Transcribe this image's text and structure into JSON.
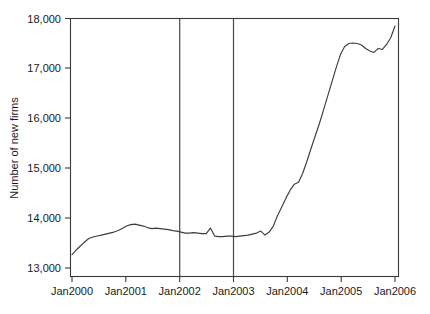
{
  "chart_data": {
    "type": "line",
    "title": "",
    "xlabel": "",
    "ylabel": "Number of new firms",
    "xlim": [
      "Jan2000",
      "Jan2006"
    ],
    "ylim": [
      13000,
      18000
    ],
    "grid": false,
    "legend": "none",
    "x_tick_labels": [
      "Jan2000",
      "Jan2001",
      "Jan2002",
      "Jan2003",
      "Jan2004",
      "Jan2005",
      "Jan2006"
    ],
    "y_tick_labels": [
      "13,000",
      "14,000",
      "15,000",
      "16,000",
      "17,000",
      "18,000"
    ],
    "y_tick_values": [
      13000,
      14000,
      15000,
      16000,
      17000,
      18000
    ],
    "annotations": [
      {
        "name": "reference-line-jan2002",
        "type": "vertical-line",
        "x": "Jan2002"
      },
      {
        "name": "reference-line-jan2003",
        "type": "vertical-line",
        "x": "Jan2003"
      }
    ],
    "series": [
      {
        "name": "New firms",
        "color": "#3d3d3d",
        "x": [
          "Jan2000",
          "Feb2000",
          "Mar2000",
          "Apr2000",
          "May2000",
          "Jun2000",
          "Jul2000",
          "Aug2000",
          "Sep2000",
          "Oct2000",
          "Nov2000",
          "Dec2000",
          "Jan2001",
          "Feb2001",
          "Mar2001",
          "Apr2001",
          "May2001",
          "Jun2001",
          "Jul2001",
          "Aug2001",
          "Sep2001",
          "Oct2001",
          "Nov2001",
          "Dec2001",
          "Jan2002",
          "Feb2002",
          "Mar2002",
          "Apr2002",
          "May2002",
          "Jun2002",
          "Jul2002",
          "Aug2002",
          "Sep2002",
          "Oct2002",
          "Nov2002",
          "Dec2002",
          "Jan2003",
          "Feb2003",
          "Mar2003",
          "Apr2003",
          "May2003",
          "Jun2003",
          "Jul2003",
          "Aug2003",
          "Sep2003",
          "Oct2003",
          "Nov2003",
          "Dec2003",
          "Jan2004",
          "Feb2004",
          "Mar2004",
          "Apr2004",
          "May2004",
          "Jun2004",
          "Jul2004",
          "Aug2004",
          "Sep2004",
          "Oct2004",
          "Nov2004",
          "Dec2004",
          "Jan2005",
          "Feb2005",
          "Mar2005",
          "Apr2005",
          "May2005",
          "Jun2005",
          "Jul2005",
          "Aug2005",
          "Sep2005",
          "Oct2005",
          "Nov2005",
          "Dec2005"
        ],
        "values": [
          13270,
          13360,
          13440,
          13520,
          13590,
          13620,
          13640,
          13660,
          13680,
          13700,
          13720,
          13750,
          13790,
          13840,
          13870,
          13880,
          13860,
          13840,
          13810,
          13790,
          13800,
          13790,
          13780,
          13770,
          13750,
          13740,
          13720,
          13700,
          13700,
          13710,
          13700,
          13690,
          13690,
          13800,
          13640,
          13630,
          13630,
          13640,
          13640,
          13630,
          13640,
          13650,
          13660,
          13680,
          13700,
          13740,
          13660,
          13720,
          13840,
          14050,
          14220,
          14400,
          14560,
          14680,
          14720,
          14900,
          15140,
          15400,
          15650,
          15900,
          16180,
          16460,
          16740,
          17020,
          17280,
          17440,
          17500,
          17510,
          17500,
          17470,
          17400,
          17350
        ]
      },
      {
        "name": "New firms (continued)",
        "color": "#3d3d3d",
        "x": [
          "Jan2006-lead-in"
        ],
        "values": [
          17850
        ]
      }
    ],
    "series_tail": {
      "x": [
        "Jan2006a",
        "Feb2006a",
        "Mar2006a",
        "Apr2006a",
        "May2006a",
        "Jun2006a"
      ],
      "values": [
        17320,
        17400,
        17380,
        17480,
        17620,
        17850
      ]
    }
  },
  "axis": {
    "y_title": "Number of new firms"
  }
}
